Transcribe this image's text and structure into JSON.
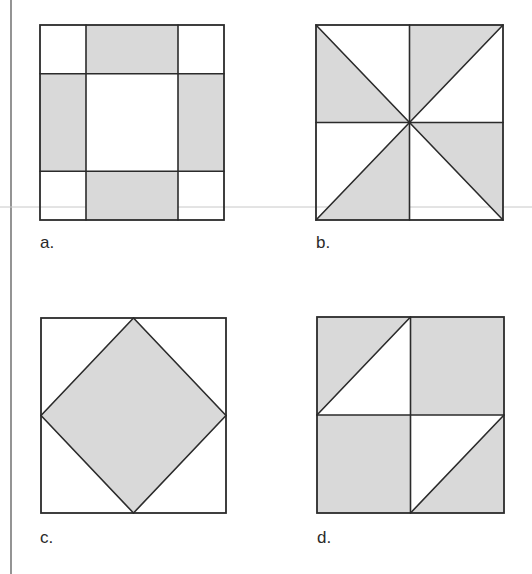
{
  "colors": {
    "background": "#ffffff",
    "stroke": "#2b2b2b",
    "shade": "#d9d9d9",
    "guide_line": "#c8c8c8",
    "margin_rule": "#5a5a5a"
  },
  "figure": {
    "panels": [
      {
        "id": "a",
        "label": "a.",
        "description": "3x3 grid block: white corners, shaded side rectangles, white center",
        "box": [
          40,
          25,
          224,
          220
        ]
      },
      {
        "id": "b",
        "label": "b.",
        "description": "Pinwheel: square split into 4 quadrants with both diagonals, alternating shaded triangles",
        "box": [
          316,
          25,
          503,
          220
        ]
      },
      {
        "id": "c",
        "label": "c.",
        "description": "Square with inscribed shaded diamond connecting edge midpoints",
        "box": [
          41,
          318,
          226,
          513
        ]
      },
      {
        "id": "d",
        "label": "d.",
        "description": "2x2 block: shaded squares with two half-white triangles in top-left and bottom-right quadrants",
        "box": [
          317,
          317,
          504,
          513
        ]
      }
    ]
  }
}
